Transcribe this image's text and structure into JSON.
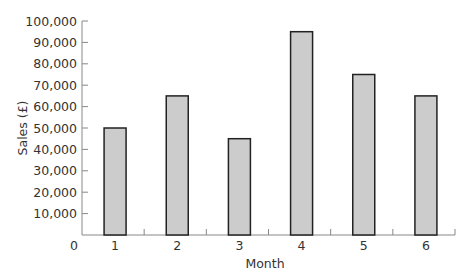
{
  "chart_data": {
    "type": "bar",
    "title": "",
    "xlabel": "Month",
    "ylabel": "Sales (£)",
    "categories": [
      "1",
      "2",
      "3",
      "4",
      "5",
      "6"
    ],
    "values": [
      50000,
      65000,
      45000,
      95000,
      75000,
      65000
    ],
    "ylim": [
      0,
      100000
    ],
    "yticks": [
      0,
      10000,
      20000,
      30000,
      40000,
      50000,
      60000,
      70000,
      80000,
      90000,
      100000
    ],
    "ytick_labels": [
      "0",
      "10,000",
      "20,000",
      "30,000",
      "40,000",
      "50,000",
      "60,000",
      "70,000",
      "80,000",
      "90,000",
      "100,000"
    ],
    "grid": false,
    "legend": null,
    "colors": {
      "bar_fill": "#cccccc",
      "bar_stroke": "#222222",
      "axis": "#888888",
      "text": "#333333"
    }
  }
}
